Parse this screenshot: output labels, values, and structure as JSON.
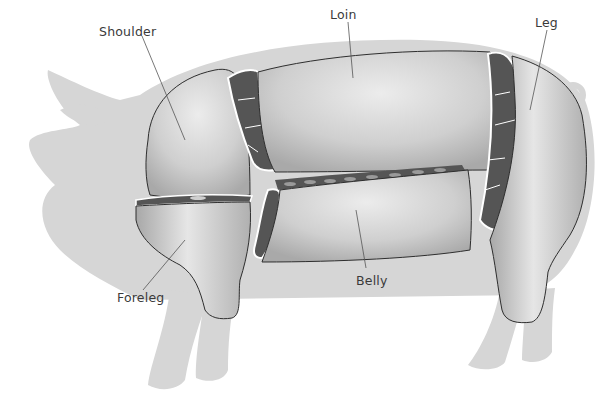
{
  "diagram": {
    "colors": {
      "background": "#ffffff",
      "silhouette": "#d6d6d6",
      "cut_surface": "#c9c9c9",
      "cut_highlight": "#e8e8e8",
      "cross_section": "#555555",
      "outline": "#2e2e2e",
      "leader_line": "#555555",
      "label_text": "#3a3a3a"
    },
    "labels": {
      "shoulder": "Shoulder",
      "loin": "Loin",
      "leg": "Leg",
      "foreleg": "Foreleg",
      "belly": "Belly"
    }
  }
}
